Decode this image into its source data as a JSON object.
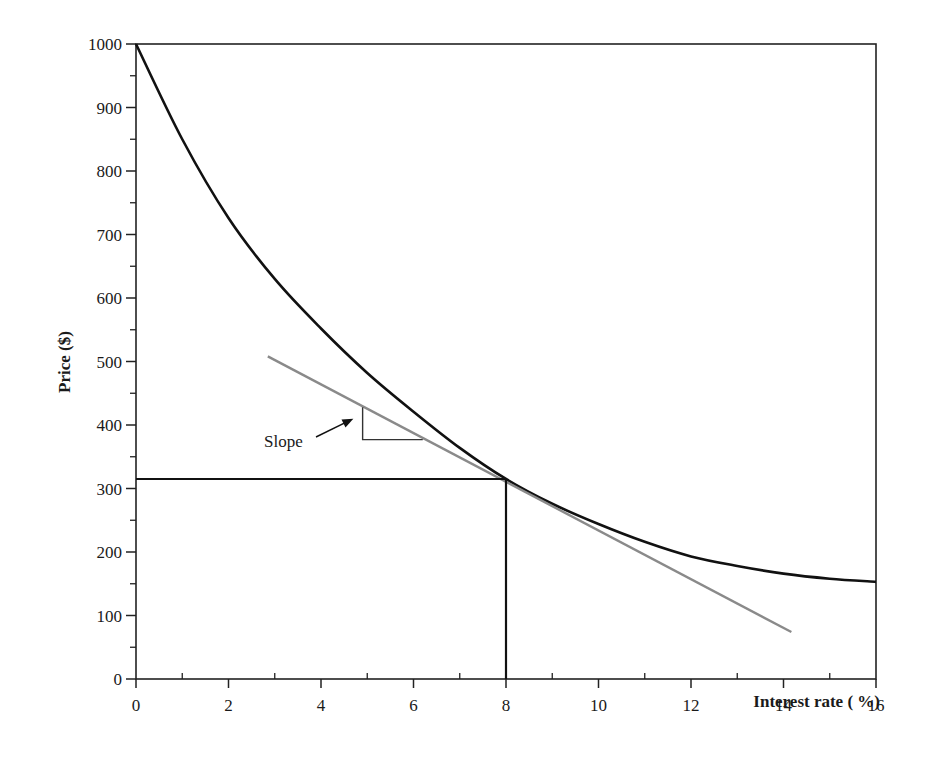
{
  "chart_data": {
    "type": "line",
    "title": "",
    "xlabel": "Interest rate ( %)",
    "ylabel": "Price ($)",
    "xlim": [
      0,
      16
    ],
    "ylim": [
      0,
      1000
    ],
    "x_ticks": [
      0,
      2,
      4,
      6,
      8,
      10,
      12,
      14,
      16
    ],
    "x_tick_labels": [
      "0",
      "2",
      "4",
      "6",
      "8",
      "10",
      "12",
      "14",
      "16"
    ],
    "x_minor_ticks": [
      1,
      3,
      5,
      7,
      9,
      11,
      13,
      15
    ],
    "y_ticks": [
      0,
      100,
      200,
      300,
      400,
      500,
      600,
      700,
      800,
      900,
      1000
    ],
    "y_tick_labels": [
      "0",
      "100",
      "200",
      "300",
      "400",
      "500",
      "600",
      "700",
      "800",
      "900",
      "1000"
    ],
    "y_minor_ticks": [
      50,
      150,
      250,
      350,
      450,
      550,
      650,
      750,
      850,
      950
    ],
    "grid": false,
    "legend": null,
    "series": [
      {
        "name": "Price curve",
        "color": "#111111",
        "x": [
          0,
          1,
          2,
          3,
          4,
          5,
          6,
          7,
          8,
          9,
          10,
          11,
          12,
          13,
          14,
          15,
          16
        ],
        "values": [
          1000,
          850,
          726,
          630,
          552,
          482,
          421,
          364,
          315,
          276,
          244,
          216,
          193,
          178,
          166,
          158,
          153
        ]
      },
      {
        "name": "Tangent at 8%",
        "color": "#8a8a8a",
        "x": [
          2.85,
          14.17
        ],
        "values": [
          508,
          74
        ]
      }
    ],
    "reference_lines": [
      {
        "name": "horizontal-price-at-8pct",
        "from": [
          0,
          315
        ],
        "to": [
          8,
          315
        ]
      },
      {
        "name": "vertical-rate-8pct",
        "from": [
          8,
          0
        ],
        "to": [
          8,
          315
        ]
      }
    ],
    "annotations": [
      {
        "text": "Slope",
        "arrow_to": [
          4.7,
          410
        ]
      },
      {
        "type": "slope-triangle",
        "vertical_x": 4.9,
        "from_y": 428,
        "to_y": 377,
        "horizontal_to_x": 6.2
      }
    ]
  },
  "labels": {
    "xlabel": "Interest rate ( %)",
    "ylabel": "Price ($)",
    "slope": "Slope"
  }
}
